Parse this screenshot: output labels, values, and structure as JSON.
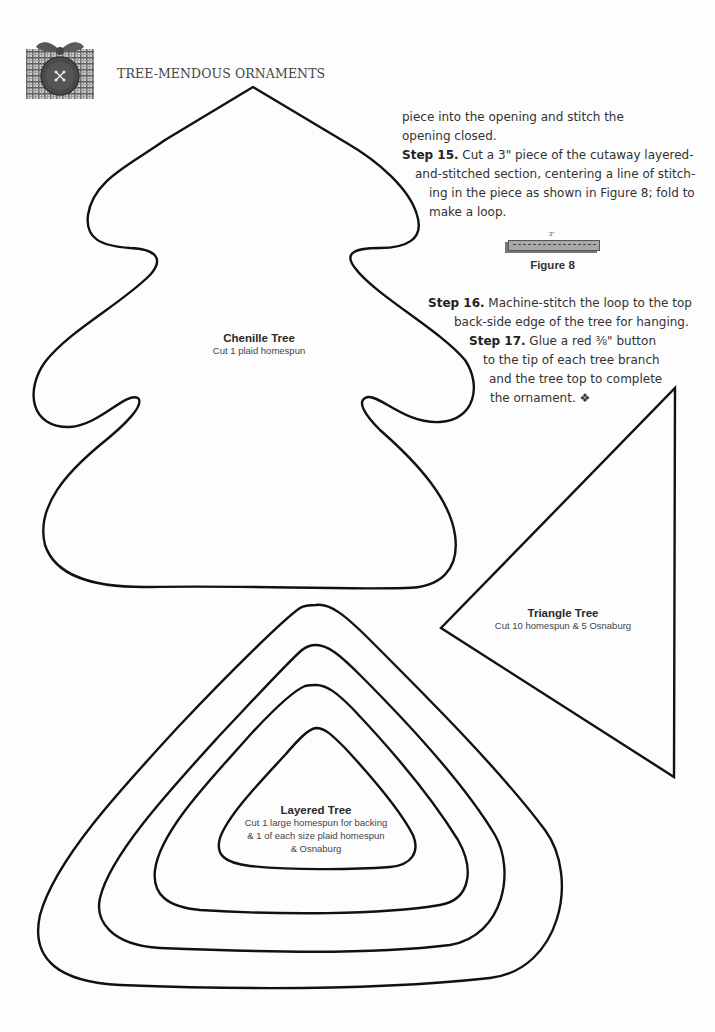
{
  "header": {
    "title": "TREE-MENDOUS ORNAMENTS",
    "photo_icon": "plaid-button-ornament-photo"
  },
  "instructions": {
    "lines": [
      {
        "bold": "",
        "text": "piece into the opening and stitch the"
      },
      {
        "bold": "",
        "text": "opening closed."
      },
      {
        "bold": "Step 15.",
        "text": " Cut a 3\" piece of the cutaway layered-"
      },
      {
        "bold": "",
        "text": "and-stitched section, centering a line of stitch-"
      },
      {
        "bold": "",
        "text": "ing in the piece as shown in Figure 8; fold to"
      },
      {
        "bold": "",
        "text": "make a loop."
      },
      {
        "bold": "Step 16.",
        "text": " Machine-stitch the loop to the top"
      },
      {
        "bold": "",
        "text": "back-side edge of the tree for hanging."
      },
      {
        "bold": "Step 17.",
        "text": " Glue a red ⅜\" button"
      },
      {
        "bold": "",
        "text": "to the tip of each tree branch"
      },
      {
        "bold": "",
        "text": "and the tree top to complete"
      },
      {
        "bold": "",
        "text": "the ornament. ❖"
      }
    ]
  },
  "figure8": {
    "dimension": "3\"",
    "caption": "Figure 8"
  },
  "patterns": {
    "chenille": {
      "title": "Chenille Tree",
      "lines": [
        "Cut 1 plaid homespun"
      ]
    },
    "triangle": {
      "title": "Triangle Tree",
      "lines": [
        "Cut 10 homespun & 5 Osnaburg"
      ]
    },
    "layered": {
      "title": "Layered Tree",
      "lines": [
        "Cut 1 large homespun for backing",
        "& 1 of each size plaid homespun",
        "& Osnaburg"
      ]
    }
  },
  "colors": {
    "outline": "#111111",
    "text": "#333333",
    "paper": "#fdfdfd"
  }
}
